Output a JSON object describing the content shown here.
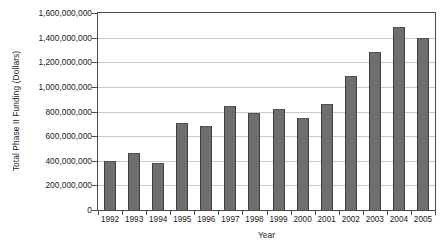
{
  "chart_data": {
    "type": "bar",
    "title": "",
    "xlabel": "Year",
    "ylabel": "Total Phase II Funding (Dollars)",
    "categories": [
      "1992",
      "1993",
      "1994",
      "1995",
      "1996",
      "1997",
      "1998",
      "1999",
      "2000",
      "2001",
      "2002",
      "2003",
      "2004",
      "2005"
    ],
    "values": [
      400000000,
      460000000,
      385000000,
      705000000,
      680000000,
      845000000,
      785000000,
      820000000,
      750000000,
      860000000,
      1085000000,
      1280000000,
      1485000000,
      1400000000
    ],
    "ylim": [
      0,
      1600000000
    ],
    "ytick_values": [
      0,
      200000000,
      400000000,
      600000000,
      800000000,
      1000000000,
      1200000000,
      1400000000,
      1600000000
    ],
    "ytick_labels": [
      "0",
      "200,000,000",
      "400,000,000",
      "600,000,000",
      "800,000,000",
      "1,000,000,000",
      "1,200,000,000",
      "1,400,000,000",
      "1,600,000,000"
    ],
    "grid": true,
    "legend": "none",
    "bar_color": "#6e6e6e",
    "bar_edge_color": "#3f3f3f",
    "gridline_color": "#c9c9c9",
    "axis_color": "#4a4a4a",
    "background_color": "#ffffff"
  }
}
